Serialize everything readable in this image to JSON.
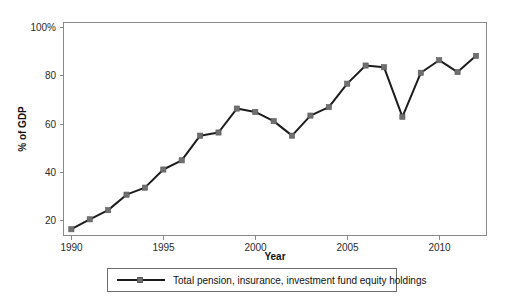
{
  "chart_data": {
    "type": "line",
    "title": "",
    "xlabel": "Year",
    "ylabel": "% of GDP",
    "x": [
      1990,
      1991,
      1992,
      1993,
      1994,
      1995,
      1996,
      1997,
      1998,
      1999,
      2000,
      2001,
      2002,
      2003,
      2004,
      2005,
      2006,
      2007,
      2008,
      2009,
      2010,
      2011,
      2012
    ],
    "series": [
      {
        "name": "Total pension, insurance, investment fund equity holdings",
        "values": [
          16.3,
          20.4,
          24.2,
          30.6,
          33.5,
          41.0,
          44.8,
          55.0,
          56.3,
          66.2,
          64.8,
          61.0,
          55.0,
          63.3,
          66.8,
          76.5,
          84.0,
          83.3,
          62.8,
          81.0,
          86.2,
          81.3,
          88.0
        ]
      }
    ],
    "xticks": [
      1990,
      1995,
      2000,
      2005,
      2010
    ],
    "xticklabels": [
      "1990",
      "1995",
      "2000",
      "2005",
      "2010"
    ],
    "yticks": [
      20,
      40,
      60,
      80,
      100
    ],
    "yticklabels": [
      "20",
      "40",
      "60",
      "80",
      "100%"
    ],
    "xlim": [
      1989.6,
      2012.6
    ],
    "ylim": [
      13.5,
      102
    ],
    "grid": false,
    "legend_position": "below-center",
    "colors": {
      "line": "#1c1c1c",
      "marker": "#6f6f6f",
      "axis": "#8a8a8a",
      "text": "#111111",
      "background": "#ffffff"
    }
  },
  "legend": {
    "entries": [
      {
        "label": "Total pension, insurance, investment fund equity holdings"
      }
    ]
  }
}
